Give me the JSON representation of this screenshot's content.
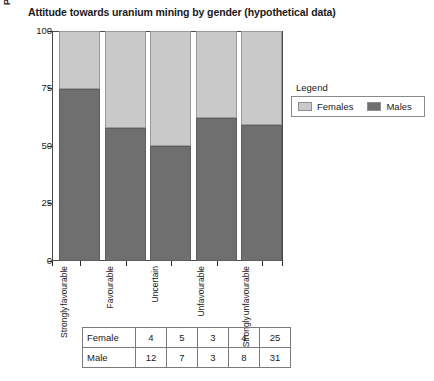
{
  "chart_data": {
    "type": "bar",
    "subtype": "stacked-percentage",
    "title": "Attitude towards uranium mining by gender (hypothetical data)",
    "xlabel": "",
    "ylabel": "Percentage of respondents",
    "ylim": [
      0,
      100
    ],
    "yticks": [
      0,
      25,
      50,
      75,
      100
    ],
    "grid": false,
    "legend_position": "right",
    "legend_title": "Legend",
    "categories": [
      "Strongly favourable",
      "Favourable",
      "Uncertain",
      "Unfavourable",
      "Strongly unfavourable"
    ],
    "category_lines": [
      [
        "Strongly",
        "favourable"
      ],
      [
        "Favourable"
      ],
      [
        "Uncertain"
      ],
      [
        "Unfavourable"
      ],
      [
        "Strongly",
        "unfavourable"
      ]
    ],
    "series": [
      {
        "name": "Males",
        "color": "#6f6f6f",
        "counts": [
          12,
          7,
          3,
          8,
          31
        ],
        "values": [
          75,
          58,
          50,
          62,
          59
        ]
      },
      {
        "name": "Females",
        "color": "#c9c9c9",
        "counts": [
          4,
          5,
          3,
          4,
          25
        ],
        "values": [
          25,
          42,
          50,
          38,
          41
        ]
      }
    ]
  },
  "legend": {
    "title": "Legend",
    "entries": [
      {
        "label": "Females",
        "color": "#c9c9c9"
      },
      {
        "label": "Males",
        "color": "#6f6f6f"
      }
    ]
  },
  "table": {
    "rows": [
      {
        "label": "Female",
        "values": [
          "4",
          "5",
          "3",
          "4",
          "25"
        ]
      },
      {
        "label": "Male",
        "values": [
          "12",
          "7",
          "3",
          "8",
          "31"
        ]
      }
    ]
  },
  "axis": {
    "y_title": "Percentage of respondents",
    "y_ticks": [
      "100",
      "75",
      "50",
      "25",
      "0"
    ]
  }
}
